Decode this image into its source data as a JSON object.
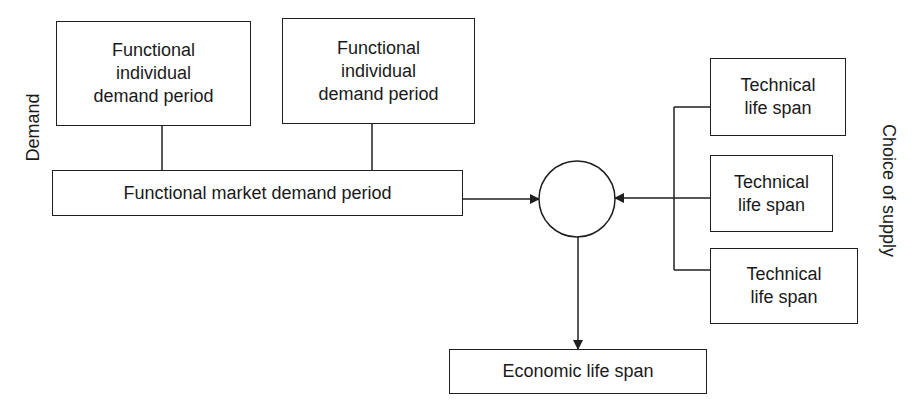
{
  "diagram": {
    "side_labels": {
      "left": "Demand",
      "right": "Choice of supply"
    },
    "demand_boxes": [
      {
        "label": "Functional\nindividual\ndemand period"
      },
      {
        "label": "Functional\nindividual\ndemand period"
      }
    ],
    "market_box": {
      "label": "Functional market demand period"
    },
    "supply_boxes": [
      {
        "label": "Technical\nlife span"
      },
      {
        "label": "Technical\nlife span"
      },
      {
        "label": "Technical\nlife span"
      }
    ],
    "result_box": {
      "label": "Economic life span"
    },
    "connectors": [
      {
        "from": "demand_boxes.0",
        "to": "market_box",
        "type": "line"
      },
      {
        "from": "demand_boxes.1",
        "to": "market_box",
        "type": "line"
      },
      {
        "from": "market_box",
        "to": "junction_circle",
        "type": "arrow"
      },
      {
        "from": "supply_boxes",
        "to": "junction_circle",
        "type": "arrow"
      },
      {
        "from": "junction_circle",
        "to": "result_box",
        "type": "arrow"
      }
    ],
    "colors": {
      "stroke": "#1f1f1f",
      "background": "#ffffff"
    }
  }
}
